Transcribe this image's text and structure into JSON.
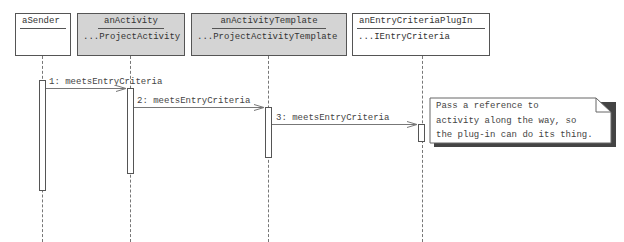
{
  "diagram_type": "UML sequence diagram",
  "objects": [
    {
      "name": "aSender",
      "class": ""
    },
    {
      "name": "anActivity",
      "class": "...ProjectActivity"
    },
    {
      "name": "anActivityTemplate",
      "class": "...ProjectActivityTemplate"
    },
    {
      "name": "anEntryCriteriaPlugIn",
      "class": "...IEntryCriteria"
    }
  ],
  "messages": [
    {
      "label": "1: meetsEntryCriteria",
      "from": "aSender",
      "to": "anActivity"
    },
    {
      "label": "2: meetsEntryCriteria",
      "from": "anActivity",
      "to": "anActivityTemplate"
    },
    {
      "label": "3: meetsEntryCriteria",
      "from": "anActivityTemplate",
      "to": "anEntryCriteriaPlugIn"
    }
  ],
  "note": {
    "text": "Pass a reference to\nactivity along the way, so\nthe plug-in can do its thing."
  },
  "colors": {
    "shaded_object": "#d4d4d4",
    "line": "#555555"
  }
}
